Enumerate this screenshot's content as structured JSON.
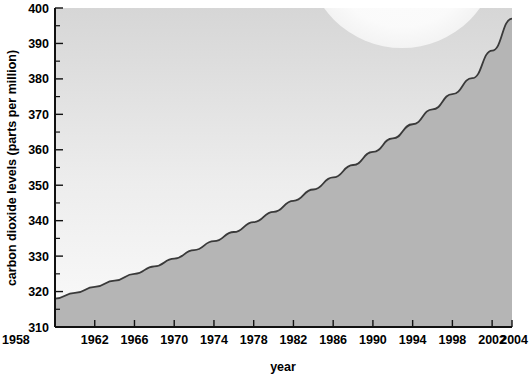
{
  "chart_data": {
    "type": "area",
    "title": "",
    "xlabel": "year",
    "ylabel": "carbon dioxide levels (parts per million)",
    "xlim": [
      1958,
      2004
    ],
    "ylim": [
      310,
      400
    ],
    "grid": false,
    "legend": null,
    "x_tick_labels": [
      "1958",
      "1962",
      "1966",
      "1970",
      "1974",
      "1978",
      "1982",
      "1986",
      "1990",
      "1994",
      "1998",
      "2002",
      "2004"
    ],
    "x_tick_values": [
      1958,
      1962,
      1966,
      1970,
      1974,
      1978,
      1982,
      1986,
      1990,
      1994,
      1998,
      2002,
      2004
    ],
    "y_tick_labels": [
      "310",
      "320",
      "330",
      "340",
      "350",
      "360",
      "370",
      "380",
      "390",
      "400"
    ],
    "y_tick_values": [
      310,
      320,
      330,
      340,
      350,
      360,
      370,
      380,
      390,
      400
    ],
    "y_minor_ticks": [
      315,
      325,
      335,
      345,
      355,
      365,
      375,
      385,
      395
    ],
    "series": [
      {
        "name": "carbon dioxide levels",
        "x": [
          1958,
          1960,
          1962,
          1964,
          1966,
          1968,
          1970,
          1972,
          1974,
          1976,
          1978,
          1980,
          1982,
          1984,
          1986,
          1988,
          1990,
          1992,
          1994,
          1996,
          1998,
          2000,
          2002,
          2004
        ],
        "values": [
          318.0,
          319.6,
          321.3,
          323.1,
          325.0,
          327.1,
          329.3,
          331.7,
          334.2,
          336.8,
          339.6,
          342.5,
          345.6,
          348.8,
          352.2,
          355.7,
          359.4,
          363.2,
          367.2,
          371.4,
          375.7,
          380.2,
          388.0,
          397.0
        ]
      }
    ],
    "colors": {
      "fill": "#b5b5b5",
      "line": "#3a3a3a",
      "plot_bg_top": "#d8d8d8",
      "plot_bg_bottom": "#f7f7f7",
      "axis": "#1a1a1a",
      "watermark": "#fafafa"
    }
  },
  "annotations": {
    "watermark_shape": "circle-overlay"
  }
}
